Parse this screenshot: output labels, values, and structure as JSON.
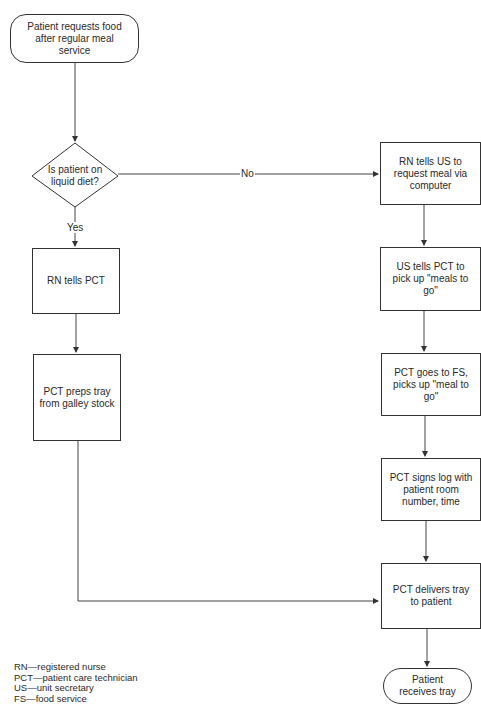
{
  "diagram": {
    "type": "flowchart",
    "nodes": {
      "start": {
        "shape": "terminator",
        "text": "Patient requests food after regular meal service"
      },
      "decision": {
        "shape": "decision",
        "text": "Is patient on liquid diet?"
      },
      "rn_tells_pct": {
        "shape": "process",
        "text": "RN tells PCT"
      },
      "pct_preps_tray": {
        "shape": "process",
        "text": "PCT preps tray from galley stock"
      },
      "rn_tells_us": {
        "shape": "process",
        "text": "RN tells US to request meal via computer"
      },
      "us_tells_pct": {
        "shape": "process",
        "text": "US tells PCT to pick up \"meals to go\""
      },
      "pct_goes_fs": {
        "shape": "process",
        "text": "PCT goes to FS, picks up \"meal to go\""
      },
      "pct_signs_log": {
        "shape": "process",
        "text": "PCT signs log with patient room number, time"
      },
      "pct_delivers": {
        "shape": "process",
        "text": "PCT delivers tray to patient"
      },
      "end": {
        "shape": "terminator",
        "text": "Patient receives tray"
      }
    },
    "edge_labels": {
      "yes": "Yes",
      "no": "No"
    },
    "edges": [
      {
        "from": "start",
        "to": "decision"
      },
      {
        "from": "decision",
        "to": "rn_tells_pct",
        "label": "Yes"
      },
      {
        "from": "decision",
        "to": "rn_tells_us",
        "label": "No"
      },
      {
        "from": "rn_tells_pct",
        "to": "pct_preps_tray"
      },
      {
        "from": "pct_preps_tray",
        "to": "pct_delivers"
      },
      {
        "from": "rn_tells_us",
        "to": "us_tells_pct"
      },
      {
        "from": "us_tells_pct",
        "to": "pct_goes_fs"
      },
      {
        "from": "pct_goes_fs",
        "to": "pct_signs_log"
      },
      {
        "from": "pct_signs_log",
        "to": "pct_delivers"
      },
      {
        "from": "pct_delivers",
        "to": "end"
      }
    ],
    "legend": [
      "RN—registered nurse",
      "PCT—patient care technician",
      "US—unit secretary",
      "FS—food service"
    ]
  }
}
